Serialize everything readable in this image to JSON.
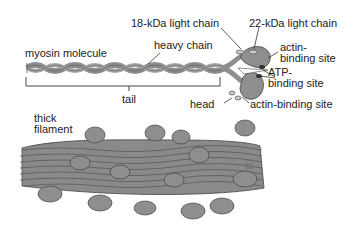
{
  "diagram": {
    "molecule": {
      "title": "myosin molecule",
      "labels": {
        "light_chain_18": "18-kDa light chain",
        "light_chain_22": "22-kDa light chain",
        "heavy_chain": "heavy chain",
        "actin_site_top_1": "actin-",
        "actin_site_top_2": "binding site",
        "atp_site_1": "ATP-",
        "atp_site_2": "binding site",
        "tail": "tail",
        "head": "head",
        "actin_site_bottom": "actin-binding site"
      }
    },
    "filament": {
      "title_1": "thick",
      "title_2": "filament"
    },
    "colors": {
      "protein_fill": "#8e8e8e",
      "protein_light": "#b5b5b5",
      "outline": "#444444",
      "text": "#222222"
    }
  }
}
